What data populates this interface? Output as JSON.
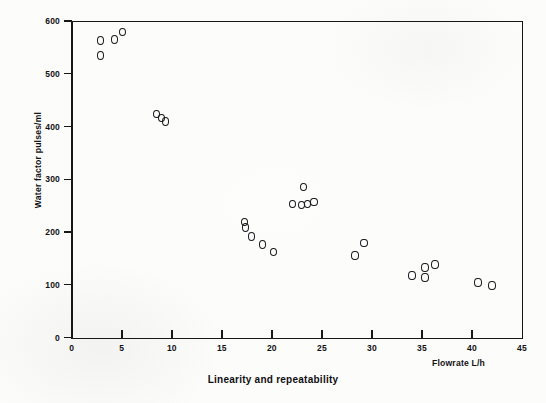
{
  "figure": {
    "caption": "Linearity and repeatability"
  },
  "chart_data": {
    "type": "scatter",
    "title": "Linearity and repeatability",
    "xlabel": "Flowrate L/h",
    "ylabel": "Water factor pulses/ml",
    "xlim": [
      0,
      45
    ],
    "ylim": [
      0,
      600
    ],
    "xticks": [
      0,
      5,
      10,
      15,
      20,
      25,
      30,
      35,
      40,
      45
    ],
    "xtick_labels": [
      "0",
      "5",
      "10",
      "15",
      "20",
      "25",
      "30",
      "35",
      "40",
      "45"
    ],
    "yticks": [
      0,
      100,
      200,
      300,
      400,
      500,
      600
    ],
    "ytick_labels": [
      "0",
      "100",
      "200",
      "300",
      "400",
      "500",
      "600"
    ],
    "grid": false,
    "legend": null,
    "marker": "open-circle",
    "series": [
      {
        "name": "Water factor",
        "points": [
          {
            "x": 2.9,
            "y": 563
          },
          {
            "x": 2.9,
            "y": 535
          },
          {
            "x": 4.3,
            "y": 565
          },
          {
            "x": 5.1,
            "y": 579
          },
          {
            "x": 8.5,
            "y": 424
          },
          {
            "x": 9.0,
            "y": 416
          },
          {
            "x": 9.4,
            "y": 409
          },
          {
            "x": 17.3,
            "y": 219
          },
          {
            "x": 17.4,
            "y": 208
          },
          {
            "x": 18.0,
            "y": 191
          },
          {
            "x": 19.1,
            "y": 176
          },
          {
            "x": 20.2,
            "y": 162
          },
          {
            "x": 22.1,
            "y": 253
          },
          {
            "x": 23.0,
            "y": 251
          },
          {
            "x": 23.2,
            "y": 285
          },
          {
            "x": 23.6,
            "y": 253
          },
          {
            "x": 24.2,
            "y": 257
          },
          {
            "x": 29.2,
            "y": 179
          },
          {
            "x": 28.3,
            "y": 155
          },
          {
            "x": 34.0,
            "y": 117
          },
          {
            "x": 35.3,
            "y": 133
          },
          {
            "x": 35.3,
            "y": 114
          },
          {
            "x": 36.3,
            "y": 138
          },
          {
            "x": 40.6,
            "y": 104
          },
          {
            "x": 42.0,
            "y": 99
          }
        ]
      }
    ]
  }
}
